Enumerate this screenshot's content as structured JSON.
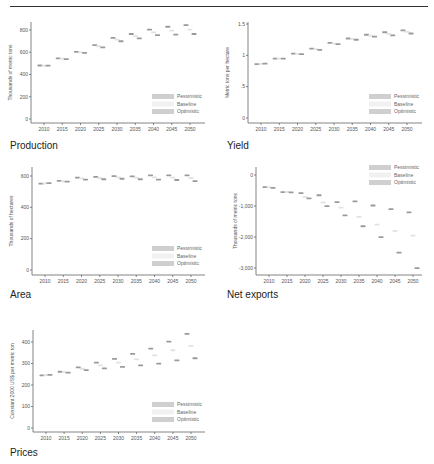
{
  "page": {
    "captions": [
      "Production",
      "Yield",
      "Area",
      "Net exports",
      "Prices"
    ]
  },
  "chart_data": [
    {
      "type": "scatter",
      "title": "Production",
      "xlabel": "",
      "ylabel": "Thousands of metric tons",
      "x": [
        2010,
        2015,
        2020,
        2025,
        2030,
        2035,
        2040,
        2045,
        2050
      ],
      "ylim": [
        0,
        900
      ],
      "yticks": [
        0,
        200,
        400,
        600,
        800
      ],
      "ytick_labels": [
        "0",
        "200",
        "400",
        "600",
        "800"
      ],
      "legend": [
        "Pessimistic",
        "Baseline",
        "Optimistic"
      ],
      "legend_position": "bottom-right",
      "series": [
        {
          "name": "Optimistic",
          "values": [
            482,
            545,
            605,
            665,
            730,
            765,
            805,
            830,
            845
          ]
        },
        {
          "name": "Baseline",
          "values": [
            481,
            543,
            600,
            655,
            715,
            745,
            780,
            795,
            805
          ]
        },
        {
          "name": "Pessimistic",
          "values": [
            480,
            540,
            595,
            645,
            700,
            725,
            755,
            760,
            765
          ]
        }
      ]
    },
    {
      "type": "scatter",
      "title": "Yield",
      "xlabel": "",
      "ylabel": "Metric tons per hectare",
      "x": [
        2010,
        2015,
        2020,
        2025,
        2030,
        2035,
        2040,
        2045,
        2050
      ],
      "ylim": [
        0,
        1.55
      ],
      "yticks": [
        0,
        0.5,
        1,
        1.5
      ],
      "ytick_labels": [
        "0",
        ".5",
        "1",
        "1.5"
      ],
      "legend": [
        "Pessimistic",
        "Baseline",
        "Optimistic"
      ],
      "legend_position": "bottom-right",
      "series": [
        {
          "name": "Optimistic",
          "values": [
            0.86,
            0.95,
            1.03,
            1.11,
            1.2,
            1.27,
            1.33,
            1.37,
            1.4
          ]
        },
        {
          "name": "Baseline",
          "values": [
            0.865,
            0.95,
            1.025,
            1.1,
            1.19,
            1.26,
            1.315,
            1.345,
            1.375
          ]
        },
        {
          "name": "Pessimistic",
          "values": [
            0.87,
            0.95,
            1.02,
            1.09,
            1.18,
            1.25,
            1.3,
            1.32,
            1.35
          ]
        }
      ]
    },
    {
      "type": "scatter",
      "title": "Area",
      "xlabel": "",
      "ylabel": "Thousands of hectares",
      "x": [
        2010,
        2015,
        2020,
        2025,
        2030,
        2035,
        2040,
        2045,
        2050
      ],
      "ylim": [
        0,
        640
      ],
      "yticks": [
        0,
        200,
        400,
        600
      ],
      "ytick_labels": [
        "0",
        "200",
        "400",
        "600"
      ],
      "legend": [
        "Pessimistic",
        "Baseline",
        "Optimistic"
      ],
      "legend_position": "bottom-right",
      "series": [
        {
          "name": "Optimistic",
          "values": [
            552,
            570,
            590,
            595,
            600,
            598,
            605,
            605,
            605
          ]
        },
        {
          "name": "Baseline",
          "values": [
            553,
            567,
            585,
            588,
            592,
            590,
            592,
            590,
            588
          ]
        },
        {
          "name": "Pessimistic",
          "values": [
            555,
            565,
            578,
            580,
            583,
            580,
            578,
            575,
            568
          ]
        }
      ]
    },
    {
      "type": "scatter",
      "title": "Net exports",
      "xlabel": "",
      "ylabel": "Thousands of metric tons",
      "x": [
        2010,
        2015,
        2020,
        2025,
        2030,
        2035,
        2040,
        2045,
        2050
      ],
      "ylim": [
        -3200,
        100
      ],
      "yticks": [
        0,
        -1000,
        -2000,
        -3000
      ],
      "ytick_labels": [
        "0",
        "-1,000",
        "-2,000",
        "-3,000"
      ],
      "legend": [
        "Pessimistic",
        "Baseline",
        "Optimistic"
      ],
      "legend_position": "top-right",
      "series": [
        {
          "name": "Optimistic",
          "values": [
            -390,
            -550,
            -580,
            -650,
            -870,
            -850,
            -980,
            -1100,
            -1200
          ]
        },
        {
          "name": "Baseline",
          "values": [
            -395,
            -540,
            -700,
            -880,
            -1050,
            -1350,
            -1600,
            -1800,
            -1950
          ]
        },
        {
          "name": "Pessimistic",
          "values": [
            -410,
            -560,
            -750,
            -1000,
            -1300,
            -1650,
            -2000,
            -2500,
            -3000
          ]
        }
      ]
    },
    {
      "type": "scatter",
      "title": "Prices",
      "xlabel": "",
      "ylabel": "Constant 2000 US$ per metric ton",
      "x": [
        2010,
        2015,
        2020,
        2025,
        2030,
        2035,
        2040,
        2045,
        2050
      ],
      "ylim": [
        0,
        460
      ],
      "yticks": [
        0,
        100,
        200,
        300,
        400
      ],
      "ytick_labels": [
        "0",
        "100",
        "200",
        "300",
        "400"
      ],
      "legend": [
        "Pessimistic",
        "Baseline",
        "Optimistic"
      ],
      "legend_position": "bottom-right",
      "series": [
        {
          "name": "Pessimistic",
          "values": [
            245,
            262,
            282,
            305,
            322,
            345,
            370,
            402,
            438
          ]
        },
        {
          "name": "Baseline",
          "values": [
            247,
            260,
            276,
            292,
            305,
            320,
            338,
            362,
            382
          ]
        },
        {
          "name": "Optimistic",
          "values": [
            248,
            258,
            270,
            278,
            285,
            292,
            300,
            315,
            325
          ]
        }
      ]
    }
  ],
  "colors": {
    "pessimistic": "#c8c8c8",
    "baseline": "#ececec",
    "optimistic": "#bdbdbd",
    "marker_dark": "#8a8a8a",
    "axis": "#666666"
  }
}
